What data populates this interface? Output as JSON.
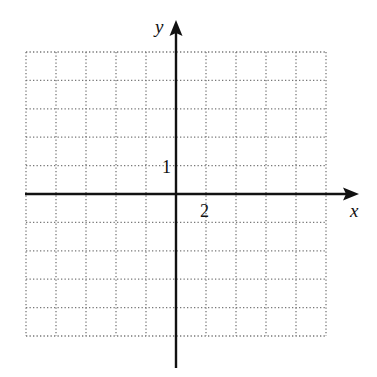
{
  "chart_data": {
    "type": "coordinate-grid",
    "title": "",
    "xlabel": "x",
    "ylabel": "y",
    "x_tick_label": "2",
    "y_tick_label": "1",
    "x_scale_per_gridline": 2,
    "y_scale_per_gridline": 1,
    "grid": true,
    "grid_style": "dotted",
    "grid_columns": 10,
    "grid_rows": 10,
    "xlim": [
      -10,
      10
    ],
    "ylim": [
      -5,
      5
    ]
  },
  "labels": {
    "x_axis": "x",
    "y_axis": "y",
    "x_tick": "2",
    "y_tick": "1"
  },
  "colors": {
    "axis": "#111111",
    "grid": "#777777"
  }
}
